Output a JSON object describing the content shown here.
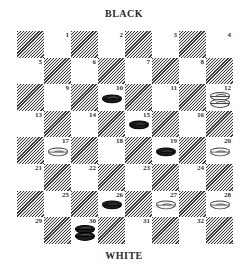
{
  "labels": {
    "top": "BLACK",
    "bottom": "WHITE"
  },
  "board": {
    "rows": 8,
    "cols": 8,
    "squares": [
      {
        "num": "1",
        "row": 0,
        "col": 1
      },
      {
        "num": "2",
        "row": 0,
        "col": 3
      },
      {
        "num": "3",
        "row": 0,
        "col": 5
      },
      {
        "num": "4",
        "row": 0,
        "col": 7
      },
      {
        "num": "5",
        "row": 1,
        "col": 0
      },
      {
        "num": "6",
        "row": 1,
        "col": 2
      },
      {
        "num": "7",
        "row": 1,
        "col": 4
      },
      {
        "num": "8",
        "row": 1,
        "col": 6
      },
      {
        "num": "9",
        "row": 2,
        "col": 1
      },
      {
        "num": "10",
        "row": 2,
        "col": 3
      },
      {
        "num": "11",
        "row": 2,
        "col": 5
      },
      {
        "num": "12",
        "row": 2,
        "col": 7
      },
      {
        "num": "13",
        "row": 3,
        "col": 0
      },
      {
        "num": "14",
        "row": 3,
        "col": 2
      },
      {
        "num": "15",
        "row": 3,
        "col": 4
      },
      {
        "num": "16",
        "row": 3,
        "col": 6
      },
      {
        "num": "17",
        "row": 4,
        "col": 1
      },
      {
        "num": "18",
        "row": 4,
        "col": 3
      },
      {
        "num": "19",
        "row": 4,
        "col": 5
      },
      {
        "num": "20",
        "row": 4,
        "col": 7
      },
      {
        "num": "21",
        "row": 5,
        "col": 0
      },
      {
        "num": "22",
        "row": 5,
        "col": 2
      },
      {
        "num": "23",
        "row": 5,
        "col": 4
      },
      {
        "num": "24",
        "row": 5,
        "col": 6
      },
      {
        "num": "25",
        "row": 6,
        "col": 1
      },
      {
        "num": "26",
        "row": 6,
        "col": 3
      },
      {
        "num": "27",
        "row": 6,
        "col": 5
      },
      {
        "num": "28",
        "row": 6,
        "col": 7
      },
      {
        "num": "29",
        "row": 7,
        "col": 0
      },
      {
        "num": "30",
        "row": 7,
        "col": 2
      },
      {
        "num": "31",
        "row": 7,
        "col": 4
      },
      {
        "num": "32",
        "row": 7,
        "col": 6
      }
    ]
  },
  "pieces": [
    {
      "square": "10",
      "color": "black",
      "type": "man"
    },
    {
      "square": "15",
      "color": "black",
      "type": "man"
    },
    {
      "square": "19",
      "color": "black",
      "type": "man"
    },
    {
      "square": "26",
      "color": "black",
      "type": "man"
    },
    {
      "square": "30",
      "color": "black",
      "type": "king"
    },
    {
      "square": "12",
      "color": "white",
      "type": "king"
    },
    {
      "square": "17",
      "color": "white",
      "type": "man"
    },
    {
      "square": "20",
      "color": "white",
      "type": "man"
    },
    {
      "square": "27",
      "color": "white",
      "type": "man"
    },
    {
      "square": "28",
      "color": "white",
      "type": "man"
    }
  ]
}
